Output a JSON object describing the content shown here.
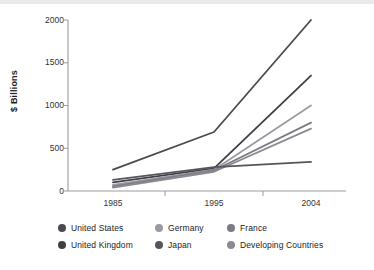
{
  "chart_data": {
    "type": "line",
    "title": "",
    "subtitle": "",
    "xlabel": "",
    "ylabel": "$ Billions",
    "categories": [
      "1985",
      "1995",
      "2004"
    ],
    "x": [
      1985,
      1995,
      2004
    ],
    "xticklabels": [
      "1985",
      "1995",
      "2004"
    ],
    "yticklabels": [
      "0",
      "500",
      "1000",
      "1500",
      "2000"
    ],
    "yticks": [
      0,
      500,
      1000,
      1500,
      2000
    ],
    "ylim": [
      0,
      2000
    ],
    "grid": false,
    "legend_position": "bottom",
    "series": [
      {
        "name": "United States",
        "values": [
          250,
          690,
          2000
        ],
        "color": "#4a4a52"
      },
      {
        "name": "United Kingdom",
        "values": [
          100,
          265,
          1350
        ],
        "color": "#3f3f46"
      },
      {
        "name": "Germany",
        "values": [
          70,
          250,
          1000
        ],
        "color": "#9a9aa2"
      },
      {
        "name": "France",
        "values": [
          55,
          240,
          800
        ],
        "color": "#7b7b84"
      },
      {
        "name": "Developing Countries",
        "values": [
          40,
          225,
          730
        ],
        "color": "#8a8a92"
      },
      {
        "name": "Japan",
        "values": [
          130,
          280,
          340
        ],
        "color": "#55555d"
      }
    ]
  },
  "axis": {
    "y_label": "$ Billions",
    "y_ticks": [
      "2000",
      "1500",
      "1000",
      "500",
      "0"
    ],
    "x_ticks": [
      "1985",
      "1995",
      "2004"
    ]
  },
  "legend": {
    "rows": [
      [
        {
          "label": "United States",
          "color": "#4a4a52"
        },
        {
          "label": "Germany",
          "color": "#9a9aa2"
        },
        {
          "label": "France",
          "color": "#7b7b84"
        }
      ],
      [
        {
          "label": "United Kingdom",
          "color": "#3f3f46"
        },
        {
          "label": "Japan",
          "color": "#55555d"
        },
        {
          "label": "Developing Countries",
          "color": "#8a8a92"
        }
      ]
    ]
  },
  "colors": {
    "axis": "#9b9b9b",
    "text": "#2b2b2b",
    "background": "#ffffff"
  }
}
